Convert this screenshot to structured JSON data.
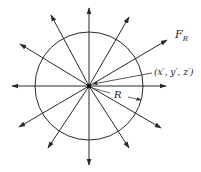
{
  "diagram": {
    "center": {
      "x": 89,
      "y": 86
    },
    "circle": {
      "radius": 54,
      "stroke": "#2a2a2a"
    },
    "line_color": "#2a2a2a",
    "arrows": [
      {
        "id": "up",
        "x": 89,
        "y": 8
      },
      {
        "id": "down",
        "x": 89,
        "y": 165
      },
      {
        "id": "left",
        "x": 12,
        "y": 86
      },
      {
        "id": "right",
        "x": 166,
        "y": 86
      },
      {
        "id": "upper-left-steep",
        "x": 51,
        "y": 15
      },
      {
        "id": "upper-left-shallow",
        "x": 20,
        "y": 44
      },
      {
        "id": "upper-right-steep",
        "x": 129,
        "y": 17
      },
      {
        "id": "upper-right-shallow",
        "x": 167,
        "y": 40
      },
      {
        "id": "lower-left-shallow",
        "x": 19,
        "y": 127
      },
      {
        "id": "lower-left-steep",
        "x": 48,
        "y": 148
      },
      {
        "id": "lower-right-shallow",
        "x": 161,
        "y": 128
      },
      {
        "id": "lower-right-steep",
        "x": 129,
        "y": 148
      }
    ],
    "labels": {
      "force": "F",
      "force_subscript": "R",
      "point": "(x′, y′, z′)",
      "radius": "R"
    }
  }
}
